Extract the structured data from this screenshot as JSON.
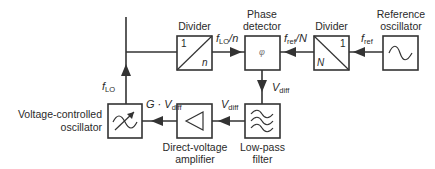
{
  "diagram": {
    "type": "block-diagram",
    "blocks": [
      {
        "id": "divider_n",
        "label": "Divider",
        "top_text": "1",
        "bottom_text": "n",
        "symbol": "diagonal-divider"
      },
      {
        "id": "phase_detector",
        "label_line1": "Phase",
        "label_line2": "detector",
        "symbol_text": "φ"
      },
      {
        "id": "divider_N",
        "label": "Divider",
        "top_text": "1",
        "bottom_text": "N",
        "symbol": "diagonal-divider"
      },
      {
        "id": "reference_oscillator",
        "label_line1": "Reference",
        "label_line2": "oscillator",
        "symbol": "sine-wave"
      },
      {
        "id": "vco",
        "label_line1": "Voltage-controlled",
        "label_line2": "oscillator",
        "symbol": "tunable-sine"
      },
      {
        "id": "amplifier",
        "label_line1": "Direct-voltage",
        "label_line2": "amplifier",
        "symbol": "triangle"
      },
      {
        "id": "low_pass_filter",
        "label_line1": "Low-pass",
        "label_line2": "filter",
        "symbol": "filter-waves"
      }
    ],
    "signals": {
      "f_lo": {
        "main": "f",
        "sub": "LO"
      },
      "f_lo_over_n": {
        "main": "f",
        "sub": "LO",
        "suffix": "/n"
      },
      "f_ref_over_N": {
        "main": "f",
        "sub": "ref",
        "suffix": "/N"
      },
      "f_ref": {
        "main": "f",
        "sub": "ref"
      },
      "v_diff_pd": {
        "main": "V",
        "sub": "diff"
      },
      "v_diff_lpf": {
        "main": "V",
        "sub": "diff"
      },
      "g_v_diff": {
        "prefix": "G · ",
        "main": "V",
        "sub": "diff"
      }
    },
    "colors": {
      "line": "#333333",
      "box_fill": "#ffffff",
      "background": "#ffffff"
    }
  }
}
